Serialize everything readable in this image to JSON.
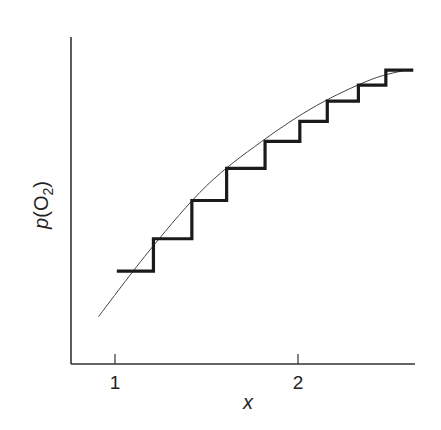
{
  "chart_data": {
    "type": "line",
    "title": "",
    "xlabel": "x",
    "ylabel": "p(O2)",
    "ylabel_parts": {
      "italic": "p",
      "text": "(O",
      "subscript": "2",
      "close": ")"
    },
    "xticks": [
      {
        "value": 1,
        "label": "1"
      },
      {
        "value": 2,
        "label": "2"
      }
    ],
    "yticks": [],
    "xlim": [
      0.69,
      2.64
    ],
    "ylim": [
      0,
      1
    ],
    "grid": false,
    "legend": null,
    "series": [
      {
        "name": "continuous curve",
        "style": "thin",
        "x": [
          0.91,
          1.2,
          1.5,
          1.8,
          2.1,
          2.4,
          2.6
        ],
        "y": [
          0.145,
          0.355,
          0.545,
          0.68,
          0.79,
          0.87,
          0.9
        ]
      },
      {
        "name": "stepwise approximation",
        "style": "thick-step",
        "x": [
          1.01,
          1.21,
          1.21,
          1.42,
          1.42,
          1.61,
          1.61,
          1.82,
          1.82,
          2.01,
          2.01,
          2.16,
          2.16,
          2.33,
          2.33,
          2.48,
          2.48,
          2.63
        ],
        "y": [
          0.284,
          0.284,
          0.383,
          0.383,
          0.5,
          0.5,
          0.598,
          0.598,
          0.681,
          0.681,
          0.742,
          0.742,
          0.804,
          0.804,
          0.853,
          0.853,
          0.899,
          0.899
        ]
      }
    ]
  },
  "layout": {
    "plot_left_px": 71,
    "plot_bottom_px": 364,
    "plot_top_px": 37,
    "x_axis_end_px": 415,
    "x1_px": 115,
    "x2_px": 298
  }
}
